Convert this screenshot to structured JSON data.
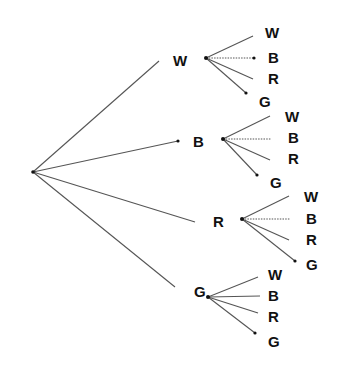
{
  "diagram": {
    "type": "probability-tree",
    "root": {
      "x": 33,
      "y": 172
    },
    "level1": [
      {
        "label": "W",
        "label_x": 173,
        "label_y": 66,
        "edge_end": {
          "x": 159,
          "y": 61
        },
        "node": {
          "x": 206,
          "y": 58
        },
        "children": [
          {
            "label": "W",
            "lx": 265,
            "ly": 38,
            "ex": 253,
            "ey": 36,
            "dot": false,
            "dotted": false
          },
          {
            "label": "B",
            "lx": 268,
            "ly": 63,
            "ex": 254,
            "ey": 58,
            "dot": true,
            "dotted": true
          },
          {
            "label": "R",
            "lx": 268,
            "ly": 84,
            "ex": 253,
            "ey": 79,
            "dot": false,
            "dotted": false
          },
          {
            "label": "G",
            "lx": 259,
            "ly": 107,
            "ex": 246,
            "ey": 93,
            "dot": true,
            "dotted": false
          }
        ]
      },
      {
        "label": "B",
        "label_x": 193,
        "label_y": 147,
        "edge_end": {
          "x": 178,
          "y": 141
        },
        "edge_end_dot": true,
        "node": {
          "x": 223,
          "y": 139
        },
        "children": [
          {
            "label": "W",
            "lx": 285,
            "ly": 122,
            "ex": 270,
            "ey": 116,
            "dot": false,
            "dotted": false
          },
          {
            "label": "B",
            "lx": 288,
            "ly": 143,
            "ex": 271,
            "ey": 139,
            "dot": false,
            "dotted": true
          },
          {
            "label": "R",
            "lx": 288,
            "ly": 164,
            "ex": 270,
            "ey": 160,
            "dot": false,
            "dotted": false
          },
          {
            "label": "G",
            "lx": 270,
            "ly": 188,
            "ex": 257,
            "ey": 175,
            "dot": true,
            "dotted": false
          }
        ]
      },
      {
        "label": "R",
        "label_x": 213,
        "label_y": 227,
        "edge_end": {
          "x": 195,
          "y": 222
        },
        "node": {
          "x": 242,
          "y": 219
        },
        "children": [
          {
            "label": "W",
            "lx": 304,
            "ly": 202,
            "ex": 289,
            "ey": 196,
            "dot": false,
            "dotted": false
          },
          {
            "label": "B",
            "lx": 306,
            "ly": 224,
            "ex": 290,
            "ey": 219,
            "dot": false,
            "dotted": true
          },
          {
            "label": "R",
            "lx": 306,
            "ly": 245,
            "ex": 289,
            "ey": 240,
            "dot": false,
            "dotted": false
          },
          {
            "label": "G",
            "lx": 306,
            "ly": 270,
            "ex": 295,
            "ey": 261,
            "dot": true,
            "dotted": false
          }
        ]
      },
      {
        "label": "G",
        "label_x": 194,
        "label_y": 297,
        "edge_end": {
          "x": 175,
          "y": 287
        },
        "node": {
          "x": 208,
          "y": 297
        },
        "children": [
          {
            "label": "W",
            "lx": 268,
            "ly": 280,
            "ex": 258,
            "ey": 277,
            "dot": false,
            "dotted": false
          },
          {
            "label": "B",
            "lx": 268,
            "ly": 301,
            "ex": 260,
            "ey": 296,
            "dot": false,
            "dotted": false
          },
          {
            "label": "R",
            "lx": 268,
            "ly": 322,
            "ex": 258,
            "ey": 313,
            "dot": false,
            "dotted": false
          },
          {
            "label": "G",
            "lx": 268,
            "ly": 347,
            "ex": 255,
            "ey": 333,
            "dot": true,
            "dotted": false
          }
        ]
      }
    ]
  }
}
